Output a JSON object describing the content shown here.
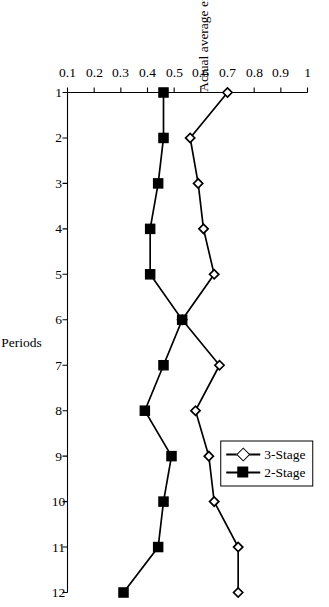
{
  "figure": {
    "rotation_degrees": 90,
    "background_color": "#ffffff",
    "line_color": "#000000"
  },
  "legend": {
    "position": "top-right-of-plot",
    "entries": [
      {
        "label": "3-Stage",
        "marker": "open-diamond",
        "color": "#000000"
      },
      {
        "label": "2-Stage",
        "marker": "filled-square",
        "color": "#000000"
      }
    ]
  },
  "chart_data": {
    "type": "line",
    "title": "",
    "subtitle": "",
    "xlabel": "Periods",
    "ylabel": "Actual average effort",
    "x": [
      1,
      2,
      3,
      4,
      5,
      6,
      7,
      8,
      9,
      10,
      11,
      12
    ],
    "categories": [
      "1",
      "2",
      "3",
      "4",
      "5",
      "6",
      "7",
      "8",
      "9",
      "10",
      "11",
      "12"
    ],
    "xlim": [
      1,
      12
    ],
    "ylim": [
      0.1,
      1
    ],
    "yticks": [
      0.1,
      0.2,
      0.3,
      0.4,
      0.5,
      0.6,
      0.7,
      0.8,
      0.9,
      1
    ],
    "ytick_labels": [
      "0.1",
      "0.2",
      "0.3",
      "0.4",
      "0.5",
      "0.6",
      "0.7",
      "0.8",
      "0.9",
      "1"
    ],
    "xticks": [
      1,
      2,
      3,
      4,
      5,
      6,
      7,
      8,
      9,
      10,
      11,
      12
    ],
    "xtick_labels": [
      "1",
      "2",
      "3",
      "4",
      "5",
      "6",
      "7",
      "8",
      "9",
      "10",
      "11",
      "12"
    ],
    "grid": false,
    "legend_position": "upper right",
    "series": [
      {
        "name": "3-Stage",
        "marker": "open-diamond",
        "color": "#000000",
        "values": [
          0.7,
          0.56,
          0.59,
          0.61,
          0.65,
          0.53,
          0.67,
          0.58,
          0.63,
          0.65,
          0.74,
          0.74
        ]
      },
      {
        "name": "2-Stage",
        "marker": "filled-square",
        "color": "#000000",
        "values": [
          0.46,
          0.46,
          0.44,
          0.41,
          0.41,
          0.53,
          0.46,
          0.39,
          0.49,
          0.46,
          0.44,
          0.31
        ]
      }
    ]
  }
}
